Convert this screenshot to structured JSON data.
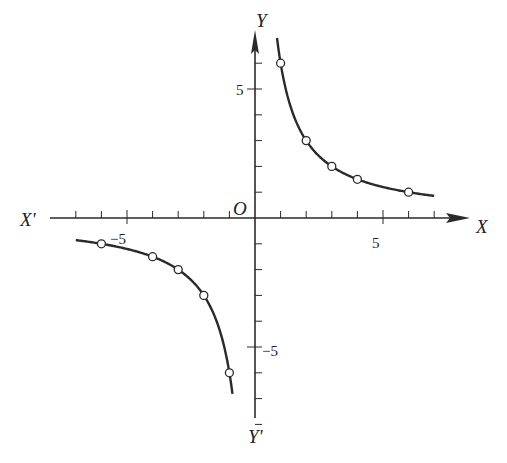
{
  "chart_data": {
    "type": "line",
    "title": "",
    "function": "y = 6/x",
    "xlabel": "X",
    "xlabel_neg": "X'",
    "ylabel": "Y",
    "ylabel_neg": "Y'",
    "origin_label": "O",
    "xlim": [
      -7.5,
      8
    ],
    "ylim": [
      -8,
      7
    ],
    "grid": false,
    "x_tick_labels": [
      {
        "value": -5,
        "label": "−5"
      },
      {
        "value": 5,
        "label": "5"
      }
    ],
    "y_tick_labels": [
      {
        "value": 5,
        "label": "5"
      },
      {
        "value": -5,
        "label": "−5"
      }
    ],
    "series": [
      {
        "name": "branch-positive",
        "x": [
          1,
          2,
          3,
          4,
          6
        ],
        "y": [
          6,
          3,
          2,
          1.5,
          1
        ]
      },
      {
        "name": "branch-negative",
        "x": [
          -6,
          -4,
          -3,
          -2,
          -1
        ],
        "y": [
          -1,
          -1.5,
          -2,
          -3,
          -6
        ]
      }
    ]
  }
}
